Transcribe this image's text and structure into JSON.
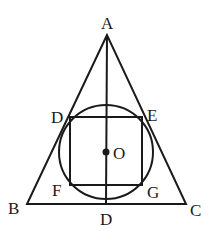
{
  "diagram": {
    "type": "geometry",
    "partial_label_left_edge": ")",
    "points": {
      "A": {
        "label": "A",
        "x": 107,
        "y": 35
      },
      "B": {
        "label": "B",
        "x": 27,
        "y": 204
      },
      "C": {
        "label": "C",
        "x": 186,
        "y": 204
      },
      "D_top": {
        "label": "D",
        "x": 70,
        "y": 117
      },
      "E": {
        "label": "E",
        "x": 142,
        "y": 117
      },
      "F": {
        "label": "F",
        "x": 70,
        "y": 185
      },
      "G": {
        "label": "G",
        "x": 142,
        "y": 185
      },
      "D_bottom": {
        "label": "D",
        "x": 106,
        "y": 204
      },
      "O": {
        "label": "O",
        "x": 106,
        "y": 152
      }
    },
    "circle": {
      "center": "O",
      "cx": 106,
      "cy": 152,
      "r": 47
    },
    "segments": [
      [
        "A",
        "B"
      ],
      [
        "B",
        "C"
      ],
      [
        "C",
        "A"
      ],
      [
        "A",
        "D_bottom"
      ],
      [
        "D_top",
        "E"
      ],
      [
        "E",
        "G"
      ],
      [
        "G",
        "F"
      ],
      [
        "F",
        "D_top"
      ]
    ]
  }
}
